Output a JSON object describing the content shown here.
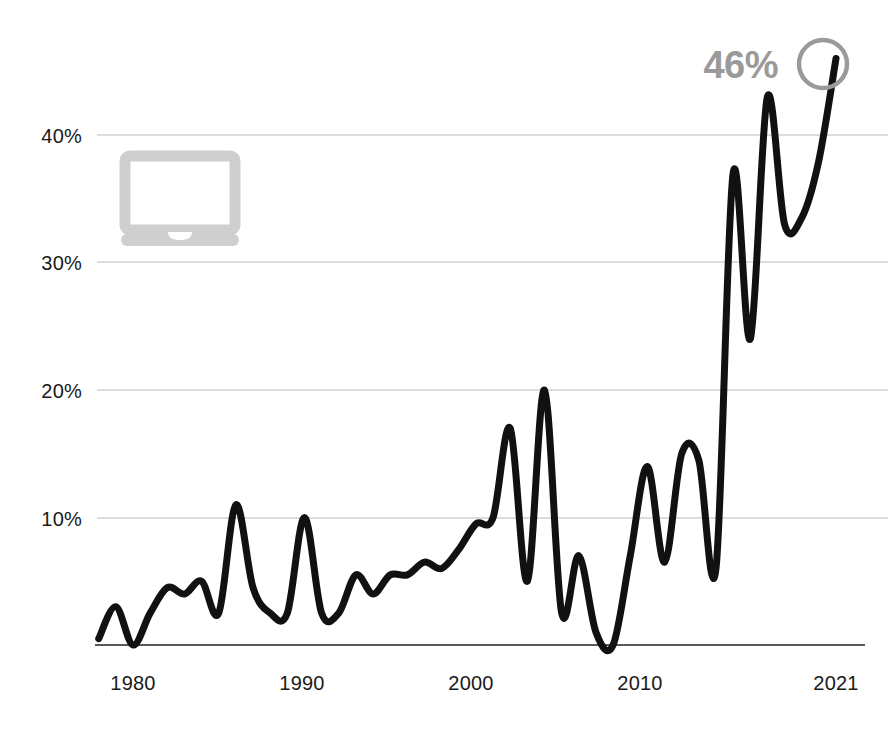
{
  "chart_data": {
    "type": "line",
    "title": "",
    "subtitle": "",
    "xlabel": "",
    "ylabel": "",
    "xlim": [
      1978,
      2021
    ],
    "ylim": [
      0,
      48
    ],
    "grid": true,
    "grid_axis": "y",
    "legend": "none",
    "y_tick_labels": [
      "10%",
      "20%",
      "30%",
      "40%"
    ],
    "y_ticks": [
      10,
      20,
      30,
      40
    ],
    "x_tick_labels": [
      "1980",
      "1990",
      "2000",
      "2010",
      "2021"
    ],
    "x_ticks": [
      1980,
      1990,
      2000,
      2010,
      2021
    ],
    "series": [
      {
        "name": "share",
        "x": [
          1978,
          1979,
          1980,
          1981,
          1982,
          1983,
          1984,
          1985,
          1986,
          1987,
          1988,
          1989,
          1990,
          1991,
          1992,
          1993,
          1994,
          1995,
          1996,
          1997,
          1998,
          1999,
          2000,
          2001,
          2002,
          2003,
          2004,
          2005,
          2006,
          2007,
          2008,
          2009,
          2010,
          2011,
          2012,
          2013,
          2014,
          2015,
          2016,
          2017,
          2018,
          2019,
          2020,
          2021
        ],
        "values": [
          0.5,
          3.0,
          0.0,
          2.5,
          4.5,
          4.0,
          5.0,
          2.5,
          11.0,
          4.5,
          2.5,
          2.5,
          10.0,
          2.5,
          2.5,
          5.5,
          4.0,
          5.5,
          5.5,
          6.5,
          6.0,
          7.5,
          9.5,
          10.0,
          17.0,
          5.0,
          20.0,
          2.5,
          7.0,
          1.0,
          0.0,
          7.0,
          14.0,
          6.5,
          15.0,
          14.5,
          6.0,
          37.0,
          24.0,
          43.0,
          33.0,
          33.5,
          38.0,
          46.0
        ]
      }
    ],
    "annotations": [
      {
        "name": "end-value-callout",
        "label": "46%",
        "x": 2021,
        "y": 46,
        "marker": "circle-outline",
        "color": "#9a9a9a"
      }
    ],
    "decorations": [
      {
        "name": "laptop-icon",
        "type": "icon",
        "color": "#cfcfcf"
      }
    ]
  },
  "axes": {
    "y_labels": [
      {
        "text": "40%",
        "value": 40
      },
      {
        "text": "30%",
        "value": 30
      },
      {
        "text": "20%",
        "value": 20
      },
      {
        "text": "10%",
        "value": 10
      }
    ],
    "x_labels": [
      {
        "text": "1980",
        "value": 1980
      },
      {
        "text": "1990",
        "value": 1990
      },
      {
        "text": "2000",
        "value": 2000
      },
      {
        "text": "2010",
        "value": 2010
      },
      {
        "text": "2021",
        "value": 2021
      }
    ]
  },
  "callout": {
    "value_label": "46%"
  },
  "colors": {
    "line": "#111111",
    "grid": "#b9b9b9",
    "axis": "#222222",
    "callout": "#9a9a9a",
    "icon": "#cfcfcf",
    "background": "#ffffff",
    "tick_text": "#1a1a1a"
  }
}
